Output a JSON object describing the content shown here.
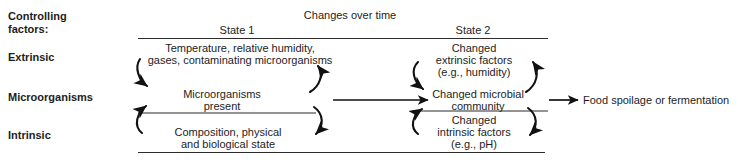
{
  "diagram": {
    "title_header": "Changes over time",
    "left_column": {
      "heading_line1": "Controlling",
      "heading_line2": "factors:",
      "rows": [
        {
          "label": "Extrinsic"
        },
        {
          "label": "Microorganisms"
        },
        {
          "label": "Intrinsic"
        }
      ]
    },
    "columns": [
      {
        "name": "state1",
        "header": "State 1"
      },
      {
        "name": "state2",
        "header": "State 2"
      }
    ],
    "state1": {
      "extrinsic_line1": "Temperature, relative humidity,",
      "extrinsic_line2": "gases, contaminating microorganisms",
      "microorganisms_line1": "Microorganisms",
      "microorganisms_line2": "present",
      "intrinsic_line1": "Composition, physical",
      "intrinsic_line2": "and biological state"
    },
    "state2": {
      "extrinsic_line1": "Changed",
      "extrinsic_line2": "extrinsic factors",
      "extrinsic_line3": "(e.g., humidity)",
      "microorganisms_line1": "Changed microbial",
      "microorganisms_line2": "community",
      "intrinsic_line1": "Changed",
      "intrinsic_line2": "intrinsic factors",
      "intrinsic_line3": "(e.g., pH)"
    },
    "outcome": "Food spoilage or fermentation",
    "colors": {
      "text": "#1d1d1d",
      "line": "#111111",
      "rule": "#2b2b2b",
      "background": "#ffffff"
    }
  }
}
